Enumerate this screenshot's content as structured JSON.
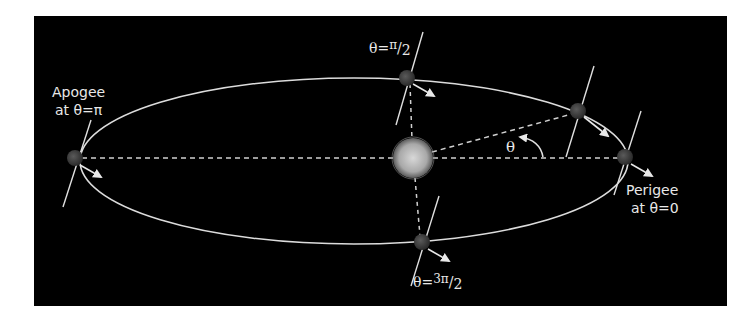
{
  "diagram": {
    "background": "#000000",
    "line_color": "#e0e0e0",
    "center_body": {
      "name": "central-star",
      "x": 413,
      "y": 158,
      "r": 20
    },
    "orbit": {
      "cx": 354,
      "cy": 161,
      "rx": 274,
      "ry": 83
    },
    "labels": {
      "apogee_line1": "Apogee",
      "apogee_line2": "at θ=π",
      "perigee_line1": "Perigee",
      "perigee_line2": "at θ=0",
      "top": "θ=π/2",
      "top_main": "θ=",
      "top_frac_num": "π",
      "top_frac_den": "2",
      "bottom_main": "θ=",
      "bottom_frac_num": "3π",
      "bottom_frac_den": "2",
      "angle": "θ"
    },
    "planets": [
      {
        "id": "apogee",
        "x": 75,
        "y": 158
      },
      {
        "id": "top",
        "x": 407,
        "y": 78
      },
      {
        "id": "theta",
        "x": 578,
        "y": 111
      },
      {
        "id": "perigee",
        "x": 625,
        "y": 157
      },
      {
        "id": "bottom",
        "x": 422,
        "y": 242
      }
    ]
  }
}
